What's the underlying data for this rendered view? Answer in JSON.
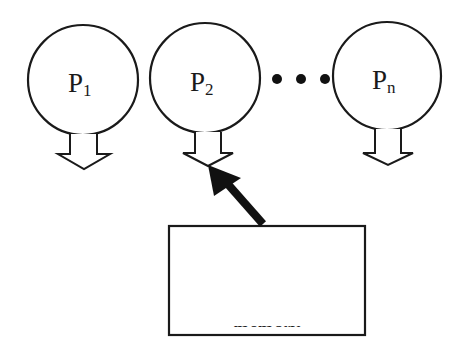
{
  "diagram": {
    "type": "shared-memory-processors",
    "processors": [
      {
        "label": "P",
        "subscript": "1",
        "cx": 83,
        "cy": 80,
        "r": 55
      },
      {
        "label": "P",
        "subscript": "2",
        "cx": 205,
        "cy": 78,
        "r": 55
      },
      {
        "label": "P",
        "subscript": "n",
        "cx": 387,
        "cy": 76,
        "r": 54
      }
    ],
    "ellipsis": "• • •",
    "memory": {
      "label": "memory"
    },
    "colors": {
      "stroke": "#1a1a1a",
      "fill": "#ffffff",
      "arrow": "#111111"
    }
  }
}
